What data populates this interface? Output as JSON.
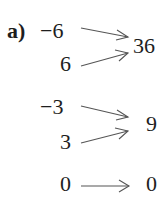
{
  "part_label": "a)",
  "groups": [
    {
      "inputs": [
        "−6",
        "6"
      ],
      "output": "36"
    },
    {
      "inputs": [
        "−3",
        "3"
      ],
      "output": "9"
    },
    {
      "inputs": [
        "0"
      ],
      "output": "0"
    }
  ],
  "arrow_color": "#555555",
  "text_color": "#1e1e1e"
}
